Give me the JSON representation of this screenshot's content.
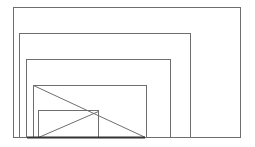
{
  "diagram": {
    "width": 255,
    "height": 147,
    "stroke_color": "#6e6e6e",
    "base_color": "#333333",
    "background": "#ffffff",
    "rectangles": [
      {
        "x": 13,
        "y": 7,
        "w": 227,
        "h": 130
      },
      {
        "x": 19,
        "y": 33,
        "w": 171,
        "h": 104
      },
      {
        "x": 26,
        "y": 59,
        "w": 144,
        "h": 78
      },
      {
        "x": 33,
        "y": 85,
        "w": 113,
        "h": 52
      },
      {
        "x": 38,
        "y": 110,
        "w": 60,
        "h": 27
      }
    ],
    "lines": [
      {
        "x1": 33,
        "y1": 85,
        "x2": 145,
        "y2": 137
      },
      {
        "x1": 38,
        "y1": 137,
        "x2": 98,
        "y2": 111
      }
    ],
    "baseline": {
      "x1": 13,
      "x2": 240,
      "y": 137
    },
    "thick_base": {
      "x1": 27,
      "x2": 145,
      "y": 137
    }
  }
}
